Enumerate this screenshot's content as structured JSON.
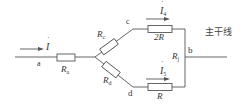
{
  "diagram": {
    "type": "circuit",
    "colors": {
      "wire": "#555555",
      "text": "#333333",
      "background": "#ffffff"
    },
    "nodes": {
      "a": "a",
      "b": "b",
      "c": "c",
      "d": "d"
    },
    "currents": {
      "main": {
        "symbol": "I",
        "subscript": "",
        "dot": "˙"
      },
      "branch_c": {
        "symbol": "I",
        "subscript": "4",
        "dot": "˙"
      },
      "branch_d": {
        "symbol": "I",
        "subscript": "5",
        "dot": "˙"
      }
    },
    "resistors": {
      "ra": {
        "symbol": "R",
        "subscript": "a"
      },
      "rc": {
        "symbol": "R",
        "subscript": "c"
      },
      "rd": {
        "symbol": "R",
        "subscript": "d"
      },
      "r_upper": {
        "label": "2R"
      },
      "r_lower": {
        "label": "R"
      },
      "rj": {
        "symbol": "R",
        "subscript": "j"
      }
    },
    "trunk_label": "主干线"
  }
}
